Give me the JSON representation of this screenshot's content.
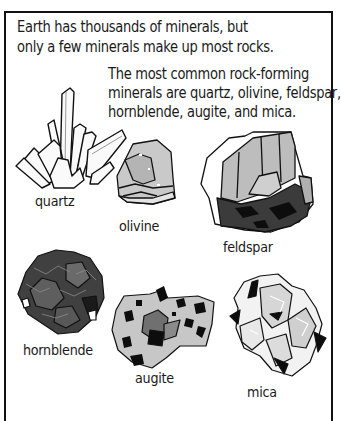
{
  "figure": {
    "intro_lines": [
      "Earth has thousands of minerals, but",
      "only a few minerals make up most rocks."
    ],
    "common_lines": [
      "The most common rock-forming",
      "minerals are quartz, olivine, feldspar,",
      "hornblende, augite, and mica."
    ],
    "minerals": [
      {
        "name": "quartz",
        "icon": "quartz-crystal-cluster-icon",
        "shade": "white"
      },
      {
        "name": "olivine",
        "icon": "olivine-rock-icon",
        "shade": "light-gray"
      },
      {
        "name": "feldspar",
        "icon": "feldspar-rock-icon",
        "shade": "gray-dark"
      },
      {
        "name": "hornblende",
        "icon": "hornblende-rock-icon",
        "shade": "dark"
      },
      {
        "name": "augite",
        "icon": "augite-rock-icon",
        "shade": "light-gray-speckled"
      },
      {
        "name": "mica",
        "icon": "mica-rock-icon",
        "shade": "white-gray"
      }
    ]
  },
  "colors": {
    "border": "#111111",
    "text": "#1a1a1a",
    "light_gray": "#c8c8c8",
    "mid_gray": "#8a8a8a",
    "dark_gray": "#3a3a3a",
    "black": "#0d0d0d"
  }
}
